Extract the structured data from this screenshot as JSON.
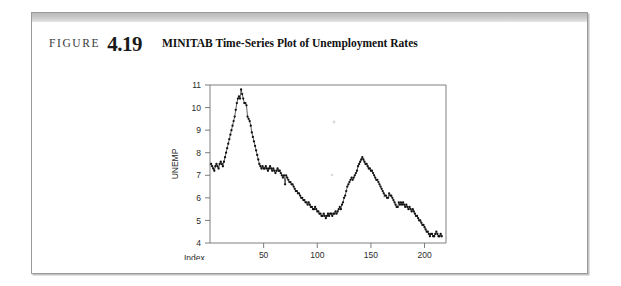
{
  "figure": {
    "label_word": "FIGURE",
    "number": "4.19",
    "title": "MINITAB Time-Series Plot of Unemployment Rates"
  },
  "chart_data": {
    "type": "line",
    "title": "MINITAB Time-Series Plot of Unemployment Rates",
    "xlabel": "Index",
    "ylabel": "UNEMP",
    "xlim": [
      0,
      220
    ],
    "ylim": [
      4,
      11
    ],
    "xticks": [
      50,
      100,
      150,
      200
    ],
    "yticks": [
      4,
      5,
      6,
      7,
      8,
      9,
      10,
      11
    ],
    "grid": false,
    "legend": null,
    "marker": "filled-circle",
    "series": [
      {
        "name": "UNEMP",
        "x": [
          1,
          2,
          3,
          4,
          5,
          6,
          7,
          8,
          9,
          10,
          11,
          12,
          13,
          14,
          15,
          16,
          17,
          18,
          19,
          20,
          21,
          22,
          23,
          24,
          25,
          26,
          27,
          28,
          29,
          30,
          31,
          32,
          33,
          34,
          35,
          36,
          37,
          38,
          39,
          40,
          41,
          42,
          43,
          44,
          45,
          46,
          47,
          48,
          49,
          50,
          51,
          52,
          53,
          54,
          55,
          56,
          57,
          58,
          59,
          60,
          61,
          62,
          63,
          64,
          65,
          66,
          67,
          68,
          69,
          70,
          71,
          72,
          73,
          74,
          75,
          76,
          77,
          78,
          79,
          80,
          81,
          82,
          83,
          84,
          85,
          86,
          87,
          88,
          89,
          90,
          91,
          92,
          93,
          94,
          95,
          96,
          97,
          98,
          99,
          100,
          101,
          102,
          103,
          104,
          105,
          106,
          107,
          108,
          109,
          110,
          111,
          112,
          113,
          114,
          115,
          116,
          117,
          118,
          119,
          120,
          121,
          122,
          123,
          124,
          125,
          126,
          127,
          128,
          129,
          130,
          131,
          132,
          133,
          134,
          135,
          136,
          137,
          138,
          139,
          140,
          141,
          142,
          143,
          144,
          145,
          146,
          147,
          148,
          149,
          150,
          151,
          152,
          153,
          154,
          155,
          156,
          157,
          158,
          159,
          160,
          161,
          162,
          163,
          164,
          165,
          166,
          167,
          168,
          169,
          170,
          171,
          172,
          173,
          174,
          175,
          176,
          177,
          178,
          179,
          180,
          181,
          182,
          183,
          184,
          185,
          186,
          187,
          188,
          189,
          190,
          191,
          192,
          193,
          194,
          195,
          196,
          197,
          198,
          199,
          200,
          201,
          202,
          203,
          204,
          205,
          206,
          207,
          208,
          209,
          210,
          211,
          212,
          213,
          214,
          215,
          216
        ],
        "values": [
          7.5,
          7.4,
          7.3,
          7.2,
          7.4,
          7.5,
          7.4,
          7.3,
          7.5,
          7.6,
          7.5,
          7.4,
          7.6,
          7.8,
          8.0,
          8.2,
          8.4,
          8.6,
          8.8,
          9.0,
          9.2,
          9.4,
          9.6,
          9.9,
          10.2,
          10.4,
          10.5,
          10.4,
          10.8,
          10.6,
          10.4,
          10.2,
          10.2,
          10.1,
          9.6,
          9.5,
          9.4,
          9.2,
          8.9,
          8.7,
          8.5,
          8.3,
          8.1,
          7.9,
          7.7,
          7.5,
          7.4,
          7.3,
          7.4,
          7.3,
          7.3,
          7.4,
          7.3,
          7.2,
          7.3,
          7.4,
          7.3,
          7.2,
          7.3,
          7.2,
          7.1,
          7.2,
          7.3,
          7.2,
          7.2,
          7.1,
          7.0,
          6.9,
          7.0,
          6.6,
          7.0,
          6.9,
          6.8,
          6.7,
          6.7,
          6.6,
          6.6,
          6.5,
          6.4,
          6.3,
          6.3,
          6.2,
          6.2,
          6.1,
          6.0,
          6.0,
          5.9,
          5.9,
          5.8,
          5.8,
          5.7,
          5.8,
          5.7,
          5.6,
          5.6,
          5.5,
          5.5,
          5.6,
          5.5,
          5.4,
          5.4,
          5.3,
          5.3,
          5.2,
          5.2,
          5.3,
          5.2,
          5.1,
          5.2,
          5.3,
          5.2,
          5.3,
          5.3,
          5.2,
          5.3,
          5.3,
          5.4,
          5.3,
          5.4,
          5.5,
          5.6,
          5.5,
          5.7,
          5.8,
          6.0,
          6.1,
          6.3,
          6.5,
          6.6,
          6.7,
          6.8,
          6.9,
          6.8,
          6.9,
          7.0,
          7.1,
          7.2,
          7.4,
          7.5,
          7.6,
          7.7,
          7.8,
          7.7,
          7.6,
          7.5,
          7.5,
          7.4,
          7.3,
          7.3,
          7.2,
          7.2,
          7.1,
          7.0,
          6.9,
          6.8,
          6.8,
          6.7,
          6.6,
          6.5,
          6.4,
          6.3,
          6.2,
          6.1,
          6.1,
          6.0,
          6.0,
          6.2,
          6.1,
          6.1,
          6.0,
          5.9,
          5.8,
          5.7,
          5.6,
          5.6,
          5.8,
          5.7,
          5.8,
          5.7,
          5.8,
          5.7,
          5.6,
          5.7,
          5.6,
          5.5,
          5.6,
          5.5,
          5.4,
          5.5,
          5.4,
          5.3,
          5.2,
          5.2,
          5.1,
          5.0,
          5.0,
          4.9,
          4.8,
          4.8,
          4.7,
          4.6,
          4.5,
          4.5,
          4.4,
          4.3,
          4.4,
          4.4,
          4.3,
          4.3,
          4.4,
          4.5,
          4.4,
          4.3,
          4.3,
          4.4,
          4.3
        ]
      }
    ]
  }
}
